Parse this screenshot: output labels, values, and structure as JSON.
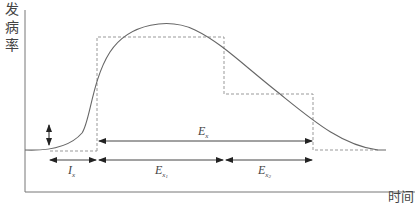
{
  "diagram": {
    "y_axis_label": [
      "发",
      "病",
      "率"
    ],
    "x_axis_label": "时间",
    "labels": {
      "ix": {
        "main": "I",
        "sub": "x"
      },
      "ex": {
        "main": "E",
        "sub": "x"
      },
      "ex1": {
        "main": "E",
        "sub": "x",
        "subsub": "1"
      },
      "ex2": {
        "main": "E",
        "sub": "x",
        "subsub": "2"
      }
    },
    "colors": {
      "curve": "#666666",
      "axis": "#666666",
      "dashed": "#999999",
      "arrow": "#222222"
    }
  }
}
